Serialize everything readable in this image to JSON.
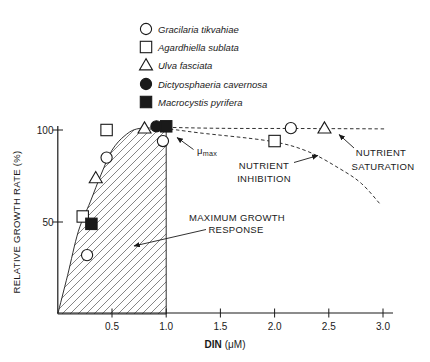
{
  "figure": {
    "background": "#ffffff",
    "ink_color": "#1a1a1a",
    "hatch_color": "#444444"
  },
  "labels": {
    "xlabel_name": "DIN",
    "xlabel_unit": "(μM)",
    "ylabel": "RELATIVE GROWTH RATE (%)",
    "mu": "μ",
    "mu_sub": "max",
    "inhibition_1": "NUTRIENT",
    "inhibition_2": "INHIBITION",
    "saturation_1": "NUTRIENT",
    "saturation_2": "SATURATION",
    "max_growth_1": "MAXIMUM GROWTH",
    "max_growth_2": "RESPONSE"
  },
  "chart_data": {
    "type": "scatter",
    "title": "",
    "xlabel": "DIN (μM)",
    "ylabel": "RELATIVE GROWTH RATE (%)",
    "xlim": [
      0,
      3.1
    ],
    "ylim": [
      0,
      112
    ],
    "x_ticks": [
      0.5,
      1.0,
      1.5,
      2.0,
      2.5,
      3.0
    ],
    "y_ticks": [
      100,
      50
    ],
    "grid": false,
    "legend_position": "top-center",
    "series": [
      {
        "name": "Gracilaria tikvahiae",
        "symbol": "circle",
        "fill": "open",
        "points": [
          [
            0.27,
            32
          ],
          [
            0.45,
            85
          ],
          [
            0.97,
            94
          ],
          [
            2.15,
            101
          ]
        ]
      },
      {
        "name": "Agardhiella sublata",
        "symbol": "square",
        "fill": "open",
        "points": [
          [
            0.23,
            53
          ],
          [
            0.45,
            100
          ],
          [
            2.0,
            94
          ]
        ]
      },
      {
        "name": "Ulva fasciata",
        "symbol": "triangle",
        "fill": "open",
        "points": [
          [
            0.35,
            74
          ],
          [
            0.8,
            101
          ],
          [
            2.46,
            101
          ]
        ]
      },
      {
        "name": "Dictyosphaeria cavernosa",
        "symbol": "circle",
        "fill": "solid",
        "points": [
          [
            0.91,
            102
          ]
        ]
      },
      {
        "name": "Macrocystis pyrifera",
        "symbol": "square",
        "fill": "solid",
        "points": [
          [
            0.31,
            49
          ],
          [
            1.0,
            102
          ]
        ]
      }
    ],
    "curves": {
      "envelope": [
        [
          0,
          0
        ],
        [
          0.09,
          21
        ],
        [
          0.19,
          45
        ],
        [
          0.3,
          61
        ],
        [
          0.4,
          76
        ],
        [
          0.5,
          89
        ],
        [
          0.62,
          97
        ],
        [
          0.75,
          100.8
        ],
        [
          1.0,
          100.8
        ]
      ],
      "saturation_line": [
        [
          0.95,
          101.5
        ],
        [
          1.5,
          100.9
        ],
        [
          2.2,
          100.8
        ],
        [
          3.02,
          100.6
        ]
      ],
      "inhibition_curve": [
        [
          0.98,
          101
        ],
        [
          1.3,
          98.5
        ],
        [
          1.95,
          94
        ],
        [
          2.3,
          88.5
        ],
        [
          2.6,
          79
        ],
        [
          2.8,
          71
        ],
        [
          2.97,
          60
        ]
      ]
    },
    "hatched_region": {
      "x_range": [
        0,
        1.0
      ],
      "label": "MAXIMUM GROWTH RESPONSE"
    },
    "annotations": [
      "μmax",
      "NUTRIENT INHIBITION",
      "NUTRIENT SATURATION",
      "MAXIMUM GROWTH RESPONSE"
    ]
  }
}
